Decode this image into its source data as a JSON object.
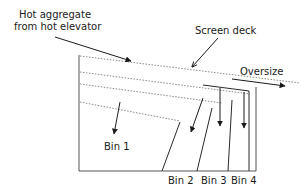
{
  "labels": {
    "feed_line1": "Hot aggregate",
    "feed_line2": "from hot elevator",
    "screen_deck": "Screen deck",
    "oversize": "Oversize",
    "bin1": "Bin 1",
    "bin2": "Bin 2",
    "bin3": "Bin 3",
    "bin4": "Bin 4"
  },
  "colors": {
    "line": "#2a2a2a",
    "deck": "#8a8a8a",
    "box": "#555555",
    "background": "#ffffff"
  }
}
